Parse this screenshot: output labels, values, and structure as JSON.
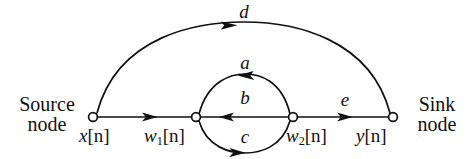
{
  "figure": {
    "type": "signal-flow-graph",
    "background_color": "#ffffff",
    "stroke_color": "#111111",
    "width": 476,
    "height": 159
  },
  "captions": {
    "source": {
      "line1": "Source",
      "line2": "node"
    },
    "sink": {
      "line1": "Sink",
      "line2": "node"
    }
  },
  "nodes": [
    {
      "id": "x",
      "label_var": "x",
      "label_sub": "",
      "label_idx": "[n]",
      "role": "source",
      "x": 93,
      "y": 117
    },
    {
      "id": "w1",
      "label_var": "w",
      "label_sub": "1",
      "label_idx": "[n]",
      "role": "internal",
      "x": 196,
      "y": 117
    },
    {
      "id": "w2",
      "label_var": "w",
      "label_sub": "2",
      "label_idx": "[n]",
      "role": "internal",
      "x": 293,
      "y": 117
    },
    {
      "id": "y",
      "label_var": "y",
      "label_sub": "",
      "label_idx": "[n]",
      "role": "sink",
      "x": 393,
      "y": 117
    }
  ],
  "branches": [
    {
      "id": "d",
      "label": "d",
      "from": "x",
      "to": "y",
      "shape": "arc-上",
      "direction": "right"
    },
    {
      "id": "a",
      "label": "a",
      "from": "w2",
      "to": "w1",
      "shape": "arc-upper",
      "direction": "left"
    },
    {
      "id": "b",
      "label": "b",
      "from": "w2",
      "to": "w1",
      "shape": "straight",
      "direction": "left"
    },
    {
      "id": "c",
      "label": "c",
      "from": "w1",
      "to": "w2",
      "shape": "arc-lower",
      "direction": "right"
    },
    {
      "id": "seg-x-w1",
      "label": "",
      "from": "x",
      "to": "w1",
      "shape": "straight",
      "direction": "right"
    },
    {
      "id": "e",
      "label": "e",
      "from": "w2",
      "to": "y",
      "shape": "straight",
      "direction": "right"
    }
  ],
  "branch_labels": {
    "d": "d",
    "a": "a",
    "b": "b",
    "c": "c",
    "e": "e"
  }
}
